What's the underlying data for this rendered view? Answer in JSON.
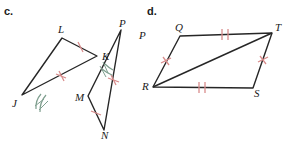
{
  "figure": {
    "width": 289,
    "height": 144,
    "background": "#ffffff",
    "stroke_color": "#262626",
    "tick_color": "#d98c8c",
    "arc_color": "#7f9f8f",
    "label_color": "#1a1a1a"
  },
  "parts": [
    {
      "id": "c",
      "label": "c.",
      "label_pos": {
        "x": 4,
        "y": 5
      },
      "shapes": [
        {
          "name": "triangle-jkl",
          "type": "polygon",
          "vertices": [
            {
              "name": "J",
              "x": 22,
              "y": 95
            },
            {
              "name": "L",
              "x": 62,
              "y": 38
            },
            {
              "name": "K",
              "x": 97,
              "y": 56
            }
          ]
        },
        {
          "name": "triangle-mnp",
          "type": "polygon",
          "vertices": [
            {
              "name": "P",
              "x": 121,
              "y": 30
            },
            {
              "name": "N",
              "x": 104,
              "y": 130
            },
            {
              "name": "M",
              "x": 88,
              "y": 96
            }
          ]
        }
      ],
      "vertex_labels": [
        {
          "name": "L",
          "text": "L",
          "x": 58,
          "y": 24
        },
        {
          "name": "K",
          "text": "K",
          "x": 102,
          "y": 51
        },
        {
          "name": "J",
          "text": "J",
          "x": 12,
          "y": 98
        },
        {
          "name": "P",
          "text": "P",
          "x": 119,
          "y": 18
        },
        {
          "name": "M",
          "text": "M",
          "x": 75,
          "y": 92
        },
        {
          "name": "N",
          "text": "N",
          "x": 101,
          "y": 130
        }
      ],
      "tick_marks": [
        {
          "name": "tick-lk",
          "x": 80,
          "y": 47,
          "angle": 27,
          "count": 1
        },
        {
          "name": "tick-jk",
          "x": 61,
          "y": 76,
          "angle": 22,
          "count": 1
        },
        {
          "name": "tick-pn",
          "x": 113,
          "y": 80,
          "angle": 80,
          "count": 1
        },
        {
          "name": "tick-mn",
          "x": 96,
          "y": 113,
          "angle": 65,
          "count": 1
        }
      ],
      "angle_arcs": [
        {
          "name": "arc-angle-j",
          "cx": 22,
          "cy": 95,
          "r": 26,
          "start": -55,
          "end": -26,
          "count": 2
        },
        {
          "name": "arc-angle-p",
          "cx": 121,
          "cy": 30,
          "r": 36,
          "start": 80,
          "end": 100,
          "count": 2
        }
      ]
    },
    {
      "id": "d",
      "label": "d.",
      "label_pos": {
        "x": 147,
        "y": 5
      },
      "shapes": [
        {
          "name": "parallelogram-qtsr",
          "type": "polygon",
          "vertices": [
            {
              "name": "Q",
              "x": 180,
              "y": 36
            },
            {
              "name": "T",
              "x": 272,
              "y": 33
            },
            {
              "name": "S",
              "x": 253,
              "y": 88
            },
            {
              "name": "R",
              "x": 153,
              "y": 87
            }
          ]
        },
        {
          "name": "diagonal-rt",
          "type": "line",
          "from": {
            "name": "R",
            "x": 153,
            "y": 87
          },
          "to": {
            "name": "T",
            "x": 272,
            "y": 33
          }
        }
      ],
      "vertex_labels": [
        {
          "name": "P",
          "text": "P",
          "x": 139,
          "y": 30
        },
        {
          "name": "Q",
          "text": "Q",
          "x": 175,
          "y": 22
        },
        {
          "name": "T",
          "text": "T",
          "x": 275,
          "y": 22
        },
        {
          "name": "R",
          "text": "R",
          "x": 142,
          "y": 81
        },
        {
          "name": "S",
          "text": "S",
          "x": 254,
          "y": 88
        }
      ],
      "tick_marks": [
        {
          "name": "tick-qt",
          "x": 226,
          "y": 34,
          "angle": -2,
          "count": 2
        },
        {
          "name": "tick-rs",
          "x": 203,
          "y": 88,
          "angle": 0,
          "count": 2
        },
        {
          "name": "tick-qr",
          "x": 166,
          "y": 61,
          "angle": 63,
          "count": 1
        },
        {
          "name": "tick-ts",
          "x": 263,
          "y": 60,
          "angle": 71,
          "count": 1
        }
      ],
      "angle_arcs": []
    }
  ]
}
